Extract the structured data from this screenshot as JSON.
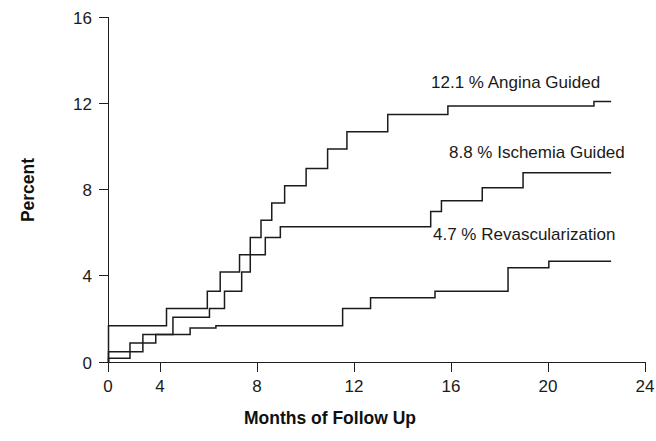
{
  "chart_data": {
    "type": "line",
    "subtype": "step",
    "title": "",
    "xlabel": "Months of Follow Up",
    "ylabel": "Percent",
    "xlim": [
      0,
      25
    ],
    "ylim": [
      0,
      16
    ],
    "xticks": [
      0,
      4,
      8,
      12,
      16,
      20,
      24
    ],
    "xtick_labels": [
      "0",
      "4",
      "8",
      "12",
      "16",
      "20",
      "24"
    ],
    "yticks": [
      0,
      4,
      8,
      12,
      16
    ],
    "ytick_labels": [
      "0",
      "4",
      "8",
      "12",
      "16"
    ],
    "grid": false,
    "legend_position": "inline-right-of-curves",
    "series": [
      {
        "name": "Angina Guided",
        "end_label": "12.1 % Angina Guided",
        "final_value": 12.1,
        "color": "#1b1b1b",
        "points": [
          [
            0.0,
            0.0
          ],
          [
            0.0,
            1.7
          ],
          [
            2.7,
            1.7
          ],
          [
            2.7,
            2.5
          ],
          [
            4.6,
            2.5
          ],
          [
            4.6,
            3.3
          ],
          [
            5.2,
            3.3
          ],
          [
            5.2,
            4.2
          ],
          [
            6.1,
            4.2
          ],
          [
            6.1,
            5.0
          ],
          [
            6.6,
            5.0
          ],
          [
            6.6,
            5.8
          ],
          [
            7.1,
            5.8
          ],
          [
            7.1,
            6.6
          ],
          [
            7.6,
            6.6
          ],
          [
            7.6,
            7.4
          ],
          [
            8.2,
            7.4
          ],
          [
            8.2,
            8.2
          ],
          [
            9.2,
            8.2
          ],
          [
            9.2,
            9.0
          ],
          [
            10.2,
            9.0
          ],
          [
            10.2,
            9.9
          ],
          [
            11.1,
            9.9
          ],
          [
            11.1,
            10.7
          ],
          [
            13.0,
            10.7
          ],
          [
            13.0,
            11.5
          ],
          [
            15.8,
            11.5
          ],
          [
            15.8,
            11.9
          ],
          [
            22.6,
            11.9
          ],
          [
            22.6,
            12.1
          ],
          [
            23.4,
            12.1
          ]
        ]
      },
      {
        "name": "Ischemia Guided",
        "end_label": "8.8 % Ischemia Guided",
        "final_value": 8.8,
        "color": "#1b1b1b",
        "points": [
          [
            0.0,
            0.0
          ],
          [
            0.0,
            0.5
          ],
          [
            1.6,
            0.5
          ],
          [
            1.6,
            1.3
          ],
          [
            3.0,
            1.3
          ],
          [
            3.0,
            2.1
          ],
          [
            4.7,
            2.1
          ],
          [
            4.7,
            2.5
          ],
          [
            5.4,
            2.5
          ],
          [
            5.4,
            3.3
          ],
          [
            6.2,
            3.3
          ],
          [
            6.2,
            4.2
          ],
          [
            6.6,
            4.2
          ],
          [
            6.6,
            5.0
          ],
          [
            7.3,
            5.0
          ],
          [
            7.3,
            5.8
          ],
          [
            8.0,
            5.8
          ],
          [
            8.0,
            6.3
          ],
          [
            15.0,
            6.3
          ],
          [
            15.0,
            7.0
          ],
          [
            15.5,
            7.0
          ],
          [
            15.5,
            7.5
          ],
          [
            17.4,
            7.5
          ],
          [
            17.4,
            8.1
          ],
          [
            19.3,
            8.1
          ],
          [
            19.3,
            8.8
          ],
          [
            23.4,
            8.8
          ]
        ]
      },
      {
        "name": "Revascularization",
        "end_label": "4.7 % Revascularization",
        "final_value": 4.7,
        "color": "#1b1b1b",
        "points": [
          [
            0.0,
            0.0
          ],
          [
            0.0,
            0.2
          ],
          [
            1.0,
            0.2
          ],
          [
            1.0,
            0.9
          ],
          [
            2.2,
            0.9
          ],
          [
            2.2,
            1.3
          ],
          [
            3.8,
            1.3
          ],
          [
            3.8,
            1.6
          ],
          [
            5.0,
            1.6
          ],
          [
            5.0,
            1.7
          ],
          [
            10.9,
            1.7
          ],
          [
            10.9,
            2.5
          ],
          [
            12.2,
            2.5
          ],
          [
            12.2,
            3.0
          ],
          [
            15.2,
            3.0
          ],
          [
            15.2,
            3.3
          ],
          [
            18.6,
            3.3
          ],
          [
            18.6,
            4.4
          ],
          [
            20.5,
            4.4
          ],
          [
            20.5,
            4.7
          ],
          [
            23.4,
            4.7
          ]
        ]
      }
    ],
    "annotations": [
      {
        "text": "12.1 % Angina Guided",
        "x_px": 431,
        "y_px": 88,
        "anchor": "start"
      },
      {
        "text": "8.8 % Ischemia Guided",
        "x_px": 449,
        "y_px": 158,
        "anchor": "start"
      },
      {
        "text": "4.7 % Revascularization",
        "x_px": 433,
        "y_px": 240,
        "anchor": "start"
      }
    ]
  },
  "axes": {
    "y_title": "Percent",
    "x_title": "Months of Follow Up",
    "y_tick_labels": [
      "16",
      "12",
      "8",
      "4",
      "0"
    ],
    "x_tick_labels": [
      "0",
      "4",
      "8",
      "12",
      "16",
      "20",
      "24"
    ]
  }
}
